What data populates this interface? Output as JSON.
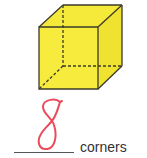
{
  "figure": {
    "shape": "cube",
    "fill_color": "#f5e93a",
    "edge_color": "#3a3a2a",
    "hidden_edges": "dashed"
  },
  "answer": {
    "value": "8",
    "color": "#e94b5b"
  },
  "label": {
    "text": "corners"
  }
}
